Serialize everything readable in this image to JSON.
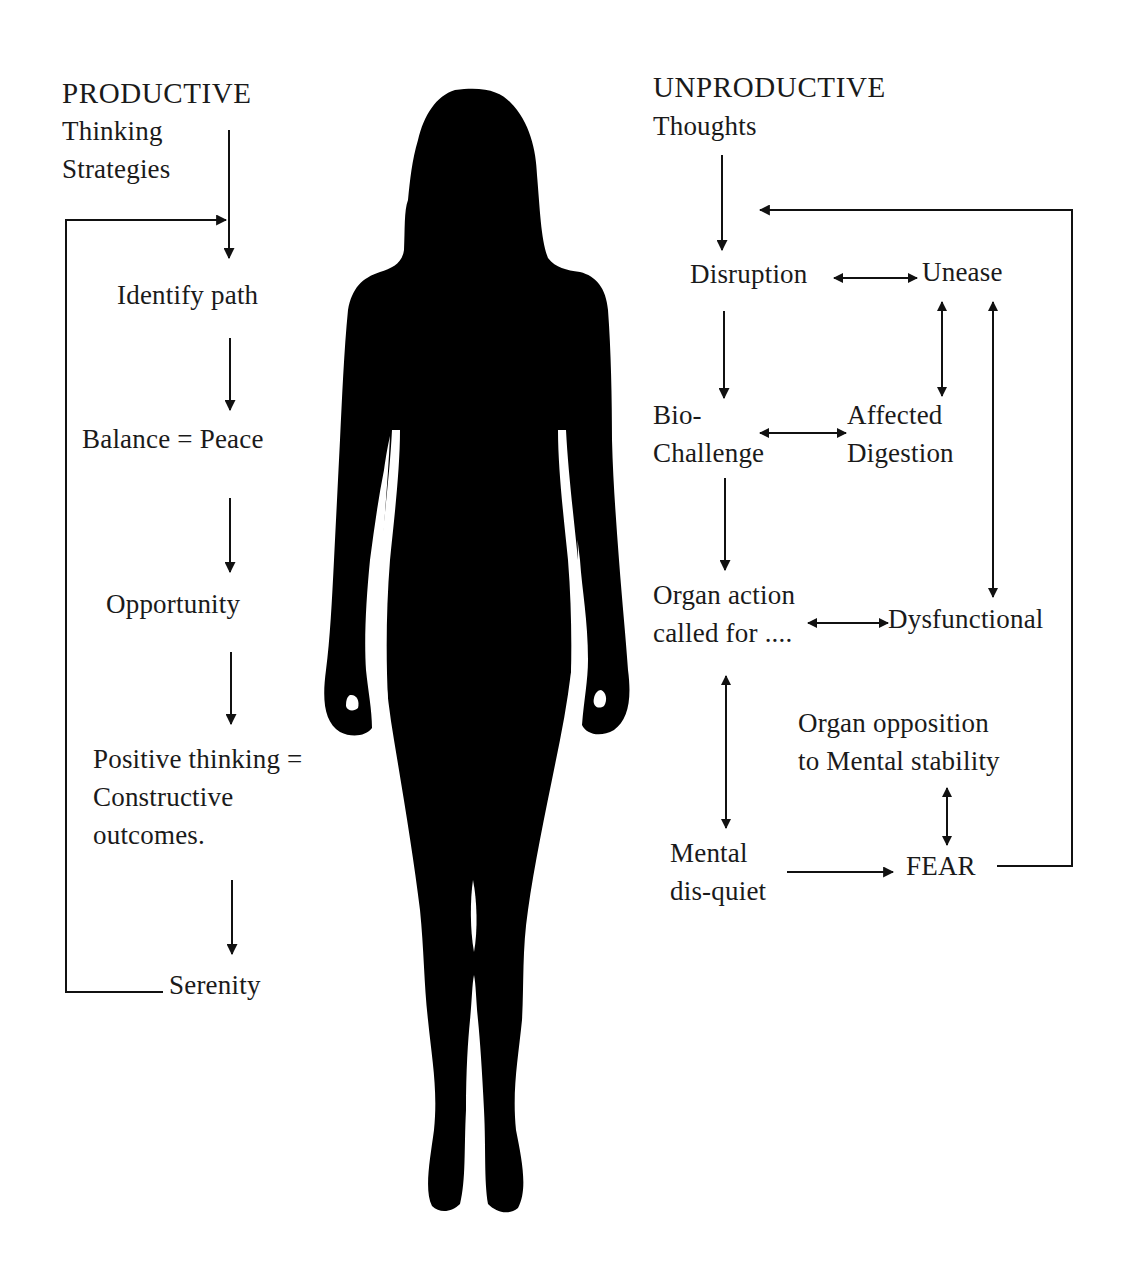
{
  "colors": {
    "background": "#ffffff",
    "ink": "#1a1a1a",
    "silhouette": "#000000"
  },
  "productive": {
    "heading": "PRODUCTIVE",
    "subheading_lines": [
      "Thinking",
      "Strategies"
    ],
    "steps": [
      {
        "id": "identify-path",
        "lines": [
          "Identify path"
        ]
      },
      {
        "id": "balance-peace",
        "lines": [
          "Balance = Peace"
        ]
      },
      {
        "id": "opportunity",
        "lines": [
          "Opportunity"
        ]
      },
      {
        "id": "positive-thinking",
        "lines": [
          "Positive thinking =",
          "Constructive",
          "outcomes."
        ]
      },
      {
        "id": "serenity",
        "lines": [
          "Serenity"
        ]
      }
    ],
    "loop": "Serenity loops back to Identify path"
  },
  "unproductive": {
    "heading": "UNPRODUCTIVE",
    "subheading_lines": [
      "Thoughts"
    ],
    "nodes": [
      {
        "id": "disruption",
        "lines": [
          "Disruption"
        ]
      },
      {
        "id": "unease",
        "lines": [
          "Unease"
        ]
      },
      {
        "id": "bio-challenge",
        "lines": [
          "Bio-",
          "Challenge"
        ]
      },
      {
        "id": "affected-digestion",
        "lines": [
          "Affected",
          "Digestion"
        ]
      },
      {
        "id": "organ-action",
        "lines": [
          "Organ action",
          "called for ...."
        ]
      },
      {
        "id": "dysfunctional",
        "lines": [
          "Dysfunctional"
        ]
      },
      {
        "id": "organ-opposition",
        "lines": [
          "Organ opposition",
          "to Mental stability"
        ]
      },
      {
        "id": "mental-disquiet",
        "lines": [
          "Mental",
          "dis-quiet"
        ]
      },
      {
        "id": "fear",
        "lines": [
          "FEAR"
        ]
      }
    ],
    "edges": [
      {
        "from": "thoughts",
        "to": "disruption",
        "type": "one-way"
      },
      {
        "from": "disruption",
        "to": "unease",
        "type": "two-way"
      },
      {
        "from": "disruption",
        "to": "bio-challenge",
        "type": "one-way"
      },
      {
        "from": "unease",
        "to": "affected-digestion",
        "type": "two-way"
      },
      {
        "from": "unease",
        "to": "dysfunctional",
        "type": "two-way"
      },
      {
        "from": "bio-challenge",
        "to": "affected-digestion",
        "type": "two-way"
      },
      {
        "from": "bio-challenge",
        "to": "organ-action",
        "type": "one-way"
      },
      {
        "from": "organ-action",
        "to": "dysfunctional",
        "type": "two-way"
      },
      {
        "from": "organ-action",
        "to": "mental-disquiet",
        "type": "two-way"
      },
      {
        "from": "organ-opposition",
        "to": "fear",
        "type": "two-way"
      },
      {
        "from": "mental-disquiet",
        "to": "fear",
        "type": "one-way"
      },
      {
        "from": "fear",
        "to": "disruption",
        "type": "loop-back"
      }
    ]
  },
  "figure": {
    "icon": "woman-silhouette-icon"
  }
}
